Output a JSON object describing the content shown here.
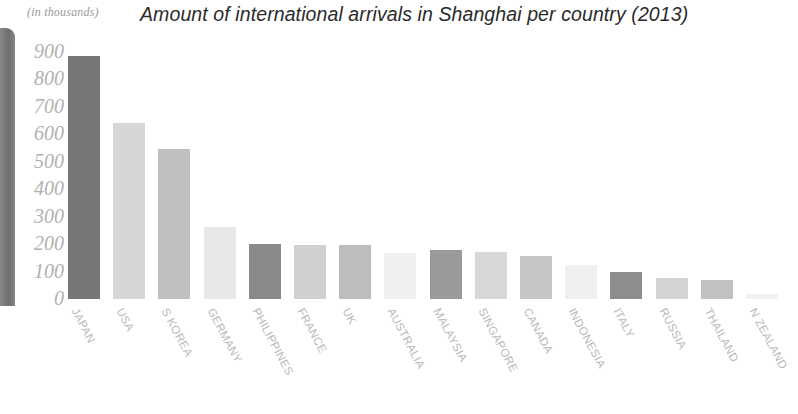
{
  "chart_data": {
    "type": "bar",
    "title": "Amount of international arrivals in Shanghai per country (2013)",
    "units_note": "(in thousands)",
    "xlabel": "",
    "ylabel": "",
    "ylim": [
      0,
      900
    ],
    "ytick_labels": [
      "900",
      "800",
      "700",
      "600",
      "500",
      "400",
      "300",
      "200",
      "100",
      "0"
    ],
    "ytick_values": [
      900,
      800,
      700,
      600,
      500,
      400,
      300,
      200,
      100,
      0
    ],
    "grid": false,
    "legend": "none",
    "categories": [
      "JAPAN",
      "USA",
      "S KOREA",
      "GERMANY",
      "PHILIPPINES",
      "FRANCE",
      "UK",
      "AUSTRALIA",
      "MALAYSIA",
      "SINGAPORE",
      "CANADA",
      "INDONESIA",
      "ITALY",
      "RUSSIA",
      "THAILAND",
      "N ZEALAND"
    ],
    "values": [
      885,
      640,
      545,
      263,
      200,
      197,
      195,
      168,
      178,
      170,
      158,
      125,
      100,
      78,
      68,
      20
    ],
    "bar_colors": [
      "#767676",
      "#d6d6d6",
      "#bfbfbf",
      "#e8e8e8",
      "#8a8a8a",
      "#cfcfcf",
      "#bdbdbd",
      "#efefef",
      "#9a9a9a",
      "#d8d8d8",
      "#c6c6c6",
      "#f0f0f0",
      "#8d8d8d",
      "#d4d4d4",
      "#c2c2c2",
      "#f2f2f2"
    ]
  },
  "colors": {
    "title": "#2b2b2b",
    "tick": "#b0b0b0",
    "category_label": "#b9b9b9",
    "page_edge": "#6f6f6f",
    "background": "#ffffff"
  }
}
